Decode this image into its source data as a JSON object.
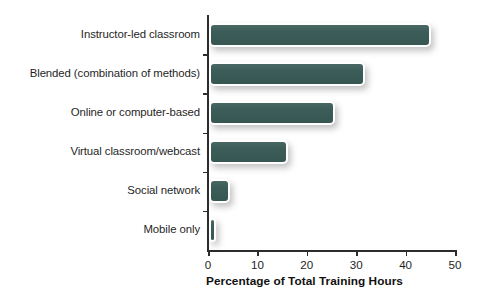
{
  "chart_data": {
    "type": "bar",
    "orientation": "horizontal",
    "title": "",
    "xlabel": "Percentage of Total Training Hours",
    "ylabel": "",
    "xlim": [
      0,
      50
    ],
    "xticks": [
      0,
      10,
      20,
      30,
      40,
      50
    ],
    "xtick_labels": [
      "0",
      "10",
      "20",
      "30",
      "40",
      "50"
    ],
    "grid": false,
    "legend": null,
    "bar_color": "#3b5c58",
    "bar_outline_color": "#ffffff",
    "background_color": "#ffffff",
    "axis_color": "#2c2c2c",
    "categories": [
      "Instructor-led classroom",
      "Blended (combination of methods)",
      "Online or computer-based",
      "Virtual classroom/webcast",
      "Social network",
      "Mobile only"
    ],
    "values": [
      45,
      31.5,
      25.5,
      16,
      4.3,
      1.5
    ]
  }
}
